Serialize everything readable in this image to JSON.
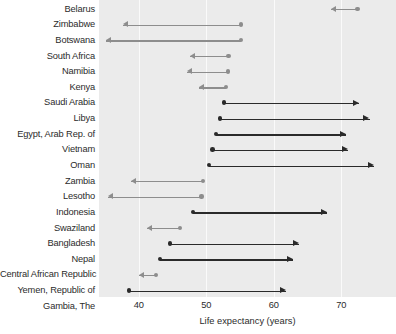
{
  "chart_data": {
    "type": "bar",
    "subtype": "arrow-range-dumbbell",
    "title": "",
    "xlabel": "Life expectancy (years)",
    "ylabel": "",
    "xlim": [
      34.1,
      78.1
    ],
    "xticks": [
      40,
      50,
      60,
      70
    ],
    "xtick_labels": [
      "40",
      "50",
      "60",
      "70"
    ],
    "grid": "vertical",
    "legend": "none",
    "categories": [
      "Belarus",
      "Zimbabwe",
      "Botswana",
      "South Africa",
      "Namibia",
      "Kenya",
      "Saudi Arabia",
      "Libya",
      "Egypt, Arab Rep. of",
      "Vietnam",
      "Oman",
      "Zambia",
      "Lesotho",
      "Indonesia",
      "Swaziland",
      "Bangladesh",
      "Nepal",
      "Central African Republic",
      "Yemen, Republic of",
      "Gambia, The"
    ],
    "series": [
      {
        "name": "start",
        "values": [
          72.4,
          55.1,
          55.1,
          53.3,
          53.2,
          52.9,
          52.6,
          52.0,
          51.4,
          50.9,
          50.4,
          49.5,
          49.3,
          48.0,
          46.1,
          44.6,
          43.1,
          42.6,
          38.5,
          36.7
        ]
      },
      {
        "name": "end",
        "values": [
          68.4,
          37.7,
          35.2,
          47.6,
          47.1,
          48.9,
          72.6,
          74.2,
          70.7,
          71.0,
          74.8,
          38.8,
          35.5,
          67.9,
          41.2,
          63.7,
          62.8,
          40.0,
          61.8,
          56.6
        ]
      }
    ],
    "points": [
      {
        "country": "Belarus",
        "start": 72.4,
        "end": 68.4,
        "direction": "decrease"
      },
      {
        "country": "Zimbabwe",
        "start": 55.1,
        "end": 37.7,
        "direction": "decrease"
      },
      {
        "country": "Botswana",
        "start": 55.1,
        "end": 35.2,
        "direction": "decrease"
      },
      {
        "country": "South Africa",
        "start": 53.3,
        "end": 47.6,
        "direction": "decrease"
      },
      {
        "country": "Namibia",
        "start": 53.2,
        "end": 47.1,
        "direction": "decrease"
      },
      {
        "country": "Kenya",
        "start": 52.9,
        "end": 48.9,
        "direction": "decrease"
      },
      {
        "country": "Saudi Arabia",
        "start": 52.6,
        "end": 72.6,
        "direction": "increase"
      },
      {
        "country": "Libya",
        "start": 52.0,
        "end": 74.2,
        "direction": "increase"
      },
      {
        "country": "Egypt, Arab Rep. of",
        "start": 51.4,
        "end": 70.7,
        "direction": "increase"
      },
      {
        "country": "Vietnam",
        "start": 50.9,
        "end": 71.0,
        "direction": "increase"
      },
      {
        "country": "Oman",
        "start": 50.4,
        "end": 74.8,
        "direction": "increase"
      },
      {
        "country": "Zambia",
        "start": 49.5,
        "end": 38.8,
        "direction": "decrease"
      },
      {
        "country": "Lesotho",
        "start": 49.3,
        "end": 35.5,
        "direction": "decrease"
      },
      {
        "country": "Indonesia",
        "start": 48.0,
        "end": 67.9,
        "direction": "increase"
      },
      {
        "country": "Swaziland",
        "start": 46.1,
        "end": 41.2,
        "direction": "decrease"
      },
      {
        "country": "Bangladesh",
        "start": 44.6,
        "end": 63.7,
        "direction": "increase"
      },
      {
        "country": "Nepal",
        "start": 43.1,
        "end": 62.8,
        "direction": "increase"
      },
      {
        "country": "Central African Republic",
        "start": 42.6,
        "end": 40.0,
        "direction": "decrease"
      },
      {
        "country": "Yemen, Republic of",
        "start": 38.5,
        "end": 61.8,
        "direction": "increase"
      },
      {
        "country": "Gambia, The",
        "start": 36.7,
        "end": 56.6,
        "direction": "increase"
      }
    ],
    "colors": {
      "decrease": "#8d8d8d",
      "increase": "#2a2a2a",
      "panel_background": "#ebebeb",
      "gridline": "#fafafa",
      "text": "#2b2b2b"
    }
  }
}
